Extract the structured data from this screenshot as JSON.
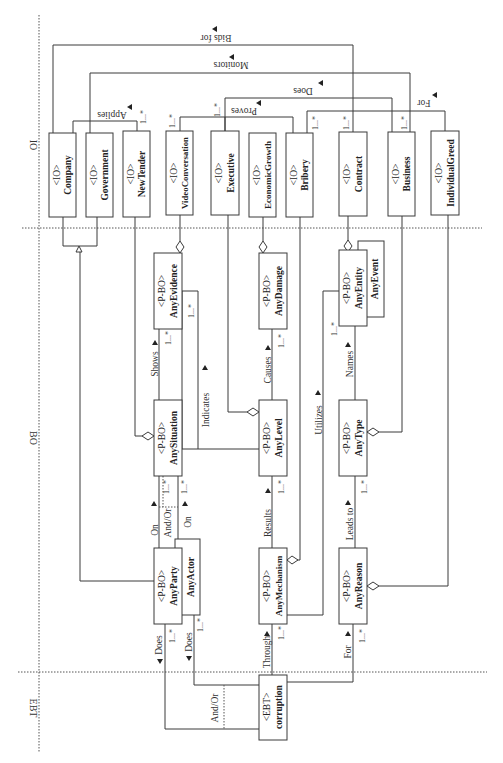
{
  "lanes": {
    "io": "IO",
    "bo": "BO",
    "ebt": "EBT"
  },
  "io_classes": [
    {
      "stereotype": "<IO>",
      "name": "Company"
    },
    {
      "stereotype": "<IO>",
      "name": "Government"
    },
    {
      "stereotype": "<IO>",
      "name": "NewTender"
    },
    {
      "stereotype": "<IO>",
      "name": "VideoConversation"
    },
    {
      "stereotype": "<IO>",
      "name": "Executive"
    },
    {
      "stereotype": "<IO>",
      "name": "EconomicGrowth"
    },
    {
      "stereotype": "<IO>",
      "name": "Bribery"
    },
    {
      "stereotype": "<IO>",
      "name": "Contract"
    },
    {
      "stereotype": "<IO>",
      "name": "Business"
    },
    {
      "stereotype": "<IO>",
      "name": "IndividualGreed"
    }
  ],
  "bo_classes": {
    "any_evidence": {
      "stereotype": "<P-BO>",
      "name": "AnyEvidence"
    },
    "any_damage": {
      "stereotype": "<P-BO>",
      "name": "AnyDamage"
    },
    "any_entity": {
      "stereotype": "<P-BO>",
      "name": "AnyEntity"
    },
    "any_event": {
      "name": "AnyEvent"
    },
    "any_situation": {
      "stereotype": "<P-BO>",
      "name": "AnySituation"
    },
    "any_level": {
      "stereotype": "<P-BO>",
      "name": "AnyLevel"
    },
    "any_type": {
      "stereotype": "<P-BO>",
      "name": "AnyType"
    },
    "any_party": {
      "stereotype": "<P-BO>",
      "name": "AnyParty"
    },
    "any_actor": {
      "name": "AnyActor"
    },
    "any_mechanism": {
      "stereotype": "<P-BO>",
      "name": "AnyMechanism"
    },
    "any_reason": {
      "stereotype": "<P-BO>",
      "name": "AnyReason"
    }
  },
  "ebt_class": {
    "stereotype": "<EBT>",
    "name": "corruption"
  },
  "associations": {
    "bids_for": "Bids for",
    "monitors": "Monitors",
    "does_top": "Does",
    "proves": "Proves",
    "applies": "Applies",
    "for_top": "For",
    "shows": "Shows",
    "indicates": "Indicates",
    "causes": "Causes",
    "names": "Names",
    "utilizes": "Utilizes",
    "on_left": "On",
    "and_or_top": "And/Or",
    "on_right": "On",
    "results": "Results",
    "leads_to": "Leads to",
    "does_party": "Does",
    "does_actor": "Does",
    "through": "Through",
    "for_bottom": "For",
    "and_or_bottom": "And/Or"
  },
  "multiplicity": "1...*"
}
